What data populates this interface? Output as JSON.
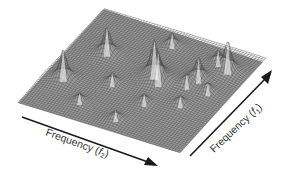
{
  "chart_data": {
    "type": "surface3d",
    "title": "",
    "x_axis": {
      "label": "Frequency (f2)",
      "label_main": "Frequency (",
      "label_var": "f",
      "label_sub": "2",
      "label_end": ")"
    },
    "y_axis": {
      "label": "Frequency (f1)",
      "label_main": "Frequency (",
      "label_var": "f",
      "label_sub": "1",
      "label_end": ")"
    },
    "grid": true,
    "legend": null,
    "plane_corners": {
      "top": [
        104,
        9
      ],
      "right": [
        263,
        62
      ],
      "bottom": [
        180,
        153
      ],
      "left": [
        18,
        103
      ]
    },
    "peaks": [
      {
        "u": 0.22,
        "v": 0.62,
        "height": 28
      },
      {
        "u": 0.5,
        "v": 0.85,
        "height": 14
      },
      {
        "u": 0.55,
        "v": 0.55,
        "height": 34
      },
      {
        "u": 0.6,
        "v": 0.5,
        "height": 28
      },
      {
        "u": 0.38,
        "v": 0.38,
        "height": 12
      },
      {
        "u": 0.12,
        "v": 0.3,
        "height": 30
      },
      {
        "u": 0.3,
        "v": 0.15,
        "height": 10
      },
      {
        "u": 0.75,
        "v": 0.55,
        "height": 10
      },
      {
        "u": 0.62,
        "v": 0.3,
        "height": 10
      },
      {
        "u": 0.8,
        "v": 0.82,
        "height": 12
      },
      {
        "u": 0.78,
        "v": 0.63,
        "height": 22
      },
      {
        "u": 0.88,
        "v": 0.78,
        "height": 30
      },
      {
        "u": 0.88,
        "v": 0.55,
        "height": 10
      },
      {
        "u": 0.8,
        "v": 0.38,
        "height": 10
      },
      {
        "u": 0.55,
        "v": 0.1,
        "height": 10
      }
    ]
  },
  "labels": {
    "f2": {
      "text": "Frequency (",
      "var": "f",
      "sub": "2",
      "close": ")"
    },
    "f1": {
      "text": "Frequency (",
      "var": "f",
      "sub": "1",
      "close": ")"
    }
  },
  "colors": {
    "mesh_fill": "#9a9a9a",
    "mesh_line": "#555555",
    "arrow": "#1a1a1a",
    "text": "#333333"
  }
}
